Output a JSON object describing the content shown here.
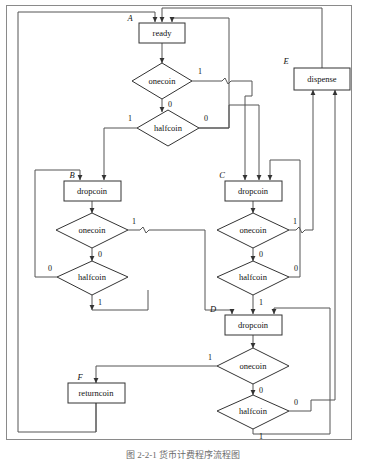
{
  "figure": {
    "caption": "图 2-2-1  货币计费程序流程图",
    "frame_color": "#8a8a8a",
    "line_color": "#555555",
    "box_stroke": "#333333",
    "background": "#ffffff"
  },
  "nodes": [
    {
      "id": "ready",
      "kind": "process",
      "label": "ready",
      "state": "A",
      "x": 162,
      "y": 33
    },
    {
      "id": "onecoin_A",
      "kind": "decision",
      "label": "onecoin",
      "state": "",
      "x": 155,
      "y": 81
    },
    {
      "id": "halfcoin_A",
      "kind": "decision",
      "label": "halfcoin",
      "state": "",
      "x": 168,
      "y": 128
    },
    {
      "id": "dropcoin_B",
      "kind": "process",
      "label": "dropcoin",
      "state": "B",
      "x": 92,
      "y": 191
    },
    {
      "id": "onecoin_B",
      "kind": "decision",
      "label": "onecoin",
      "state": "",
      "x": 92,
      "y": 230
    },
    {
      "id": "halfcoin_B",
      "kind": "decision",
      "label": "halfcoin",
      "state": "",
      "x": 92,
      "y": 277
    },
    {
      "id": "dropcoin_C",
      "kind": "process",
      "label": "dropcoin",
      "state": "C",
      "x": 253,
      "y": 191
    },
    {
      "id": "onecoin_C",
      "kind": "decision",
      "label": "onecoin",
      "state": "",
      "x": 253,
      "y": 230
    },
    {
      "id": "halfcoin_C",
      "kind": "decision",
      "label": "halfcoin",
      "state": "",
      "x": 253,
      "y": 277
    },
    {
      "id": "dropcoin_D",
      "kind": "process",
      "label": "dropcoin",
      "state": "D",
      "x": 253,
      "y": 325
    },
    {
      "id": "onecoin_D",
      "kind": "decision",
      "label": "onecoin",
      "state": "",
      "x": 253,
      "y": 366
    },
    {
      "id": "halfcoin_D",
      "kind": "decision",
      "label": "halfcoin",
      "state": "",
      "x": 253,
      "y": 411
    },
    {
      "id": "dispense",
      "kind": "process",
      "label": "dispense",
      "state": "E",
      "x": 322,
      "y": 78
    },
    {
      "id": "returncoin",
      "kind": "process",
      "label": "returncoin",
      "state": "F",
      "x": 96,
      "y": 393
    }
  ],
  "edge_labels": {
    "onecoin_A_1": "1",
    "onecoin_A_0": "0",
    "halfcoin_A_1": "1",
    "halfcoin_A_0": "0",
    "onecoin_B_1": "1",
    "onecoin_B_0": "0",
    "halfcoin_B_1": "1",
    "halfcoin_B_0": "0",
    "onecoin_C_1": "1",
    "onecoin_C_0": "0",
    "halfcoin_C_1": "1",
    "halfcoin_C_0": "0",
    "onecoin_D_1": "1",
    "onecoin_D_0": "0",
    "halfcoin_D_1": "1",
    "halfcoin_D_0": "0"
  },
  "state_labels": {
    "A": "A",
    "B": "B",
    "C": "C",
    "D": "D",
    "E": "E",
    "F": "F"
  }
}
